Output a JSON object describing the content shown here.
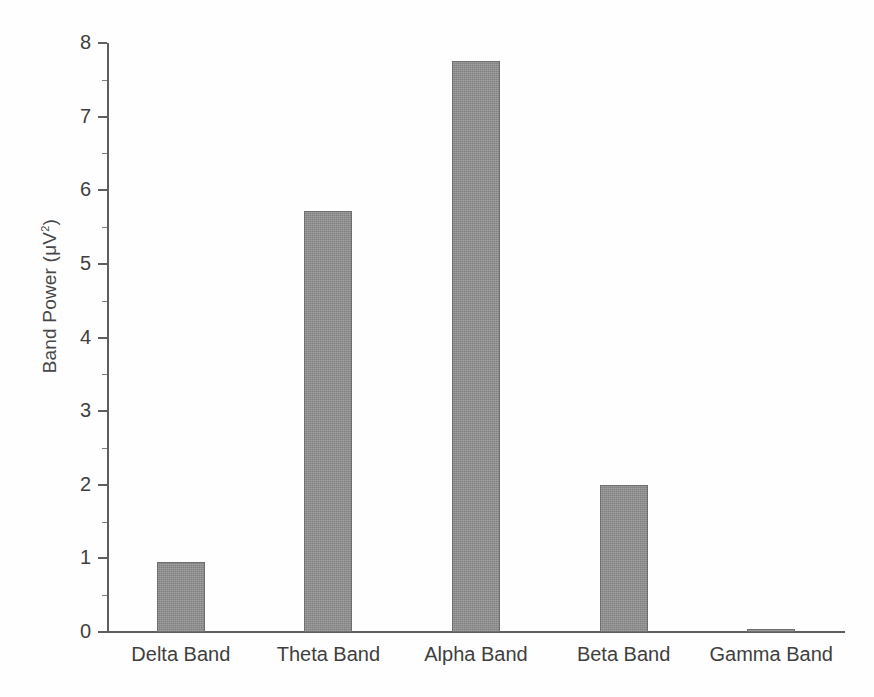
{
  "chart_data": {
    "type": "bar",
    "title": "",
    "xlabel": "",
    "ylabel": "Band Power (μV²)",
    "ylabel_base": "Band Power (μV",
    "ylabel_sup": "2",
    "ylabel_close": ")",
    "categories": [
      "Delta Band",
      "Theta Band",
      "Alpha Band",
      "Beta Band",
      "Gamma Band"
    ],
    "values": [
      0.95,
      5.72,
      7.75,
      1.99,
      0.04
    ],
    "ylim": [
      0,
      8
    ],
    "ytick_labels": [
      "0",
      "1",
      "2",
      "3",
      "4",
      "5",
      "6",
      "7",
      "8"
    ],
    "ytick_values": [
      0,
      1,
      2,
      3,
      4,
      5,
      6,
      7,
      8
    ],
    "yminor_values": [
      0.5,
      1.5,
      2.5,
      3.5,
      4.5,
      5.5,
      6.5,
      7.5
    ],
    "grid": false,
    "legend": false,
    "bar_color": "#8d8d8d",
    "bar_edge_color": "#6f6f6f",
    "axis_color": "#5e5e5e",
    "background": "#ffffff"
  },
  "axis": {
    "y_tick_0": "0",
    "y_tick_1": "1",
    "y_tick_2": "2",
    "y_tick_3": "3",
    "y_tick_4": "4",
    "y_tick_5": "5",
    "y_tick_6": "6",
    "y_tick_7": "7",
    "y_tick_8": "8"
  },
  "bars": [
    {
      "label": "Delta Band",
      "value": 0.95
    },
    {
      "label": "Theta Band",
      "value": 5.72
    },
    {
      "label": "Alpha Band",
      "value": 7.75
    },
    {
      "label": "Beta Band",
      "value": 1.99
    },
    {
      "label": "Gamma Band",
      "value": 0.04
    }
  ]
}
